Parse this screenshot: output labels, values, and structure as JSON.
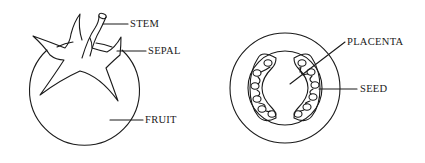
{
  "diagram": {
    "left_figure": {
      "name": "tomato whole fruit",
      "labels": {
        "stem": "STEM",
        "sepal": "SEPAL",
        "fruit": "FRUIT"
      }
    },
    "right_figure": {
      "name": "tomato cross section",
      "labels": {
        "placenta": "PLACENTA",
        "seed": "SEED"
      }
    },
    "colors": {
      "line": "#1a1a1a",
      "background": "#ffffff"
    }
  }
}
